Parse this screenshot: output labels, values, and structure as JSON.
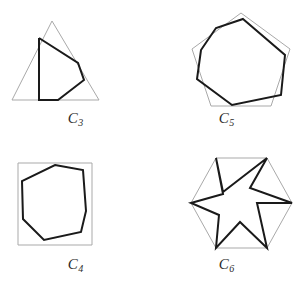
{
  "figure": {
    "background_color": "#ffffff",
    "outer_stroke_color": "#a9a9a9",
    "inner_stroke_color": "#1a1a1a",
    "width": 302,
    "height": 291
  },
  "panels": [
    {
      "id": "c3",
      "label_letter": "C",
      "label_index": "3",
      "outer_shape": "triangle",
      "outer_sides": 3,
      "outer_points": "52,21 99,100 12,100",
      "inner_shape": "quadrilateral",
      "inner_sides": 5,
      "inner_points": "39,38 78,63 84,80 58,100 39,100 39,38"
    },
    {
      "id": "c5",
      "label_letter": "C",
      "label_index": "5",
      "outer_shape": "pentagon",
      "outer_sides": 5,
      "outer_points": "241,13 290,49 271,106 211,106 192,49"
    },
    {
      "id": "c4",
      "label_letter": "C",
      "label_index": "4",
      "outer_shape": "square",
      "outer_sides": 4,
      "outer_points": "18,163 92,163 92,245 18,245"
    },
    {
      "id": "c6",
      "label_letter": "C",
      "label_index": "6",
      "outer_shape": "hexagon",
      "outer_sides": 6,
      "outer_points": "216,158 267,158 292,203 267,248 216,248 191,203"
    }
  ]
}
